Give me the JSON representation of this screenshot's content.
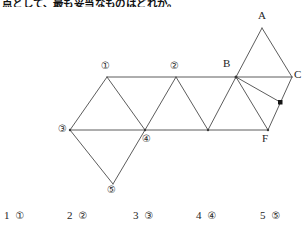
{
  "question": {
    "text": "点として、最も妥当なものはどれか。"
  },
  "figure": {
    "caption": "triangular-net-diagram",
    "stroke_color": "#4a4a4a",
    "vertex_labels": [
      {
        "name": "A",
        "text": "A",
        "x": 258,
        "y": 8
      },
      {
        "name": "B",
        "text": "B",
        "x": 225,
        "y": 58
      },
      {
        "name": "C",
        "text": "C",
        "x": 294,
        "y": 66
      },
      {
        "name": "F",
        "text": "F",
        "x": 263,
        "y": 132
      }
    ],
    "circled_labels": [
      {
        "name": "1",
        "text": "①",
        "x": 102,
        "y": 62
      },
      {
        "name": "2",
        "text": "②",
        "x": 171,
        "y": 62
      },
      {
        "name": "3",
        "text": "③",
        "x": 62,
        "y": 124
      },
      {
        "name": "4",
        "text": "④",
        "x": 147,
        "y": 130
      },
      {
        "name": "5",
        "text": "⑤",
        "x": 108,
        "y": 180
      }
    ],
    "right_angle_marker": {
      "x": 280,
      "y": 102,
      "size": 4
    }
  },
  "answers": {
    "choices": [
      {
        "number": "1",
        "mark": "①",
        "x": 4
      },
      {
        "number": "2",
        "mark": "②",
        "x": 67
      },
      {
        "number": "3",
        "mark": "③",
        "x": 133
      },
      {
        "number": "4",
        "mark": "④",
        "x": 196
      },
      {
        "number": "5",
        "mark": "⑤",
        "x": 260
      }
    ]
  }
}
